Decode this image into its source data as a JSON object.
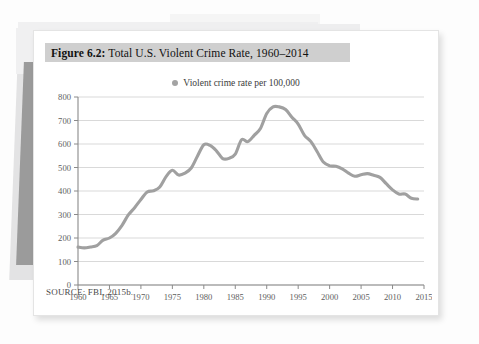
{
  "figure": {
    "number_label": "Figure 6.2:",
    "caption": " Total U.S. Violent Crime Rate, 1960–2014",
    "source_note": "SOURCE: FBI, 2015b.",
    "caption_band_color": "#cfcfcf",
    "card_background": "#ffffff"
  },
  "legend": {
    "marker_color": "#a3a3a3",
    "label": "Violent crime rate per 100,000"
  },
  "chart_data": {
    "type": "line",
    "title": "Total U.S. Violent Crime Rate, 1960–2014",
    "xlabel": "",
    "ylabel": "",
    "xlim": [
      1960,
      2015
    ],
    "ylim": [
      0,
      800
    ],
    "grid": true,
    "legend_position": "top-center",
    "line_color": "#a0a0a0",
    "x_ticks": [
      1960,
      1965,
      1970,
      1975,
      1980,
      1985,
      1990,
      1995,
      2000,
      2005,
      2010,
      2015
    ],
    "x_tick_labels": [
      "1960",
      "1965",
      "1970",
      "1975",
      "1980",
      "1985",
      "1990",
      "1995",
      "2000",
      "2005",
      "2010",
      "2015"
    ],
    "y_ticks": [
      0,
      100,
      200,
      300,
      400,
      500,
      600,
      700,
      800
    ],
    "y_tick_labels": [
      "0",
      "100",
      "200",
      "300",
      "400",
      "500",
      "600",
      "700",
      "800"
    ],
    "series": [
      {
        "name": "Violent crime rate per 100,000",
        "x": [
          1960,
          1961,
          1962,
          1963,
          1964,
          1965,
          1966,
          1967,
          1968,
          1969,
          1970,
          1971,
          1972,
          1973,
          1974,
          1975,
          1976,
          1977,
          1978,
          1979,
          1980,
          1981,
          1982,
          1983,
          1984,
          1985,
          1986,
          1987,
          1988,
          1989,
          1990,
          1991,
          1992,
          1993,
          1994,
          1995,
          1996,
          1997,
          1998,
          1999,
          2000,
          2001,
          2002,
          2003,
          2004,
          2005,
          2006,
          2007,
          2008,
          2009,
          2010,
          2011,
          2012,
          2013,
          2014
        ],
        "values": [
          161,
          158,
          162,
          168,
          191,
          200,
          220,
          254,
          298,
          329,
          364,
          396,
          401,
          417,
          461,
          488,
          468,
          476,
          498,
          549,
          597,
          594,
          571,
          538,
          539,
          557,
          618,
          610,
          637,
          666,
          730,
          758,
          758,
          747,
          714,
          685,
          637,
          611,
          568,
          523,
          507,
          505,
          494,
          476,
          463,
          469,
          474,
          467,
          458,
          431,
          405,
          387,
          387,
          369,
          366
        ]
      }
    ]
  }
}
